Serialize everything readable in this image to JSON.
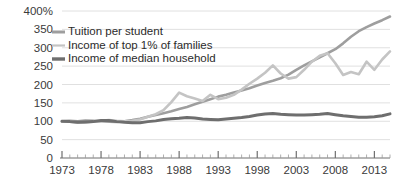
{
  "chart_data": {
    "type": "line",
    "title": "",
    "subtitle": "",
    "xlabel": "",
    "ylabel": "",
    "xlim": [
      1973,
      2015
    ],
    "ylim": [
      0,
      400
    ],
    "grid": true,
    "legend_position": "top-left",
    "y_ticks": [
      0,
      50,
      100,
      150,
      200,
      250,
      300,
      350,
      400
    ],
    "y_tick_labels": [
      "0",
      "50",
      "100",
      "150",
      "200",
      "250",
      "300",
      "350",
      "400%"
    ],
    "x_ticks": [
      1973,
      1978,
      1983,
      1988,
      1993,
      1998,
      2003,
      2008,
      2013
    ],
    "x_tick_labels": [
      "1973",
      "1978",
      "1983",
      "1988",
      "1993",
      "1998",
      "2003",
      "2008",
      "2013"
    ],
    "x_minor_tick_step": 1,
    "x": [
      1973,
      1974,
      1975,
      1976,
      1977,
      1978,
      1979,
      1980,
      1981,
      1982,
      1983,
      1984,
      1985,
      1986,
      1987,
      1988,
      1989,
      1990,
      1991,
      1992,
      1993,
      1994,
      1995,
      1996,
      1997,
      1998,
      1999,
      2000,
      2001,
      2002,
      2003,
      2004,
      2005,
      2006,
      2007,
      2008,
      2009,
      2010,
      2011,
      2012,
      2013,
      2014,
      2015
    ],
    "series": [
      {
        "name": "Tuition per student",
        "color": "#9e9e9e",
        "stroke_width": 2.6,
        "values": [
          100,
          101,
          100,
          102,
          101,
          100,
          99,
          98,
          100,
          103,
          107,
          112,
          117,
          122,
          127,
          133,
          139,
          146,
          153,
          160,
          167,
          172,
          178,
          184,
          190,
          197,
          204,
          210,
          217,
          227,
          240,
          252,
          263,
          274,
          285,
          296,
          312,
          330,
          345,
          356,
          366,
          375,
          385
        ]
      },
      {
        "name": "Income of top 1% of families",
        "color": "#c4c4c4",
        "stroke_width": 2.6,
        "values": [
          100,
          99,
          96,
          97,
          99,
          101,
          103,
          101,
          100,
          101,
          105,
          112,
          119,
          130,
          152,
          178,
          168,
          162,
          155,
          172,
          160,
          164,
          172,
          186,
          202,
          216,
          232,
          252,
          230,
          216,
          220,
          240,
          262,
          278,
          285,
          258,
          226,
          234,
          228,
          262,
          240,
          268,
          290
        ]
      },
      {
        "name": "Income of median household",
        "color": "#6e6e6e",
        "stroke_width": 3.0,
        "values": [
          100,
          99,
          97,
          98,
          99,
          102,
          102,
          99,
          97,
          96,
          96,
          99,
          101,
          105,
          107,
          108,
          110,
          109,
          106,
          105,
          104,
          106,
          108,
          110,
          113,
          117,
          120,
          121,
          119,
          118,
          117,
          117,
          118,
          119,
          121,
          118,
          115,
          113,
          111,
          111,
          112,
          115,
          120
        ]
      }
    ],
    "legend": [
      {
        "label": "Tuition per student",
        "color": "#9e9e9e"
      },
      {
        "label": "Income of top 1% of families",
        "color": "#c4c4c4"
      },
      {
        "label": "Income of median household",
        "color": "#6e6e6e"
      }
    ]
  }
}
